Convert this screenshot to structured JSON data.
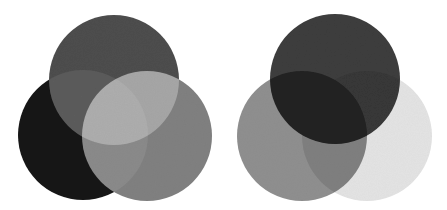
{
  "figure": {
    "type": "color-mixing-venn-pair",
    "background_color": "#ffffff",
    "width": 447,
    "height": 210,
    "grain_texture": true
  },
  "diagrams": [
    {
      "id": "additive",
      "name": "Additive color mixing",
      "blend_mode": "screen",
      "center_overlap_color": "#ffffff",
      "viewbox": "0 0 223 210",
      "circles": [
        {
          "name": "top-circle",
          "position_label": "top",
          "cx": 114,
          "cy": 80,
          "r": 65,
          "color": "#4d4d4d"
        },
        {
          "name": "bottom-left-circle",
          "position_label": "bottom-left",
          "cx": 83,
          "cy": 135,
          "r": 65,
          "color": "#141414"
        },
        {
          "name": "bottom-right-circle",
          "position_label": "bottom-right",
          "cx": 147,
          "cy": 136,
          "r": 65,
          "color": "#808080"
        }
      ],
      "pairwise_overlaps": [
        {
          "name": "top-and-bottom-left",
          "color": "#565656"
        },
        {
          "name": "top-and-bottom-right",
          "color": "#a6a6a6"
        },
        {
          "name": "bottom-left-and-bottom-right",
          "color": "#8a8a8a"
        }
      ]
    },
    {
      "id": "subtractive",
      "name": "Subtractive color mixing",
      "blend_mode": "multiply",
      "center_overlap_color": "#0d0d0d",
      "viewbox": "0 0 224 210",
      "circles": [
        {
          "name": "top-circle",
          "position_label": "top",
          "cx": 112,
          "cy": 79,
          "r": 65,
          "color": "#3d3d3d"
        },
        {
          "name": "bottom-left-circle",
          "position_label": "bottom-left",
          "cx": 79,
          "cy": 136,
          "r": 65,
          "color": "#8f8f8f"
        },
        {
          "name": "bottom-right-circle",
          "position_label": "bottom-right",
          "cx": 144,
          "cy": 136,
          "r": 65,
          "color": "#e3e3e3"
        }
      ],
      "pairwise_overlaps": [
        {
          "name": "top-and-bottom-left",
          "color": "#1f1f1f"
        },
        {
          "name": "top-and-bottom-right",
          "color": "#3a3a3a"
        },
        {
          "name": "bottom-left-and-bottom-right",
          "color": "#868686"
        }
      ]
    }
  ]
}
